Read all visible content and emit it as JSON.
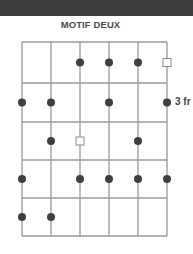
{
  "header": {
    "title": "MOTIF DEUX"
  },
  "diagram": {
    "type": "guitar-fretboard",
    "strings": 6,
    "frets": 5,
    "start_fret_label": "3 fr",
    "start_fret_label_row": 2,
    "colors": {
      "grid": "#9a9a9a",
      "dot": "#3f3f3f",
      "square_stroke": "#8a8a8a",
      "topbar": "#3d3d3d"
    },
    "markers": [
      {
        "fret": 1,
        "string": 3,
        "shape": "dot"
      },
      {
        "fret": 1,
        "string": 4,
        "shape": "dot"
      },
      {
        "fret": 1,
        "string": 5,
        "shape": "dot"
      },
      {
        "fret": 1,
        "string": 6,
        "shape": "square"
      },
      {
        "fret": 2,
        "string": 1,
        "shape": "dot"
      },
      {
        "fret": 2,
        "string": 2,
        "shape": "dot"
      },
      {
        "fret": 2,
        "string": 4,
        "shape": "dot"
      },
      {
        "fret": 2,
        "string": 6,
        "shape": "dot"
      },
      {
        "fret": 3,
        "string": 2,
        "shape": "dot"
      },
      {
        "fret": 3,
        "string": 3,
        "shape": "square"
      },
      {
        "fret": 3,
        "string": 5,
        "shape": "dot"
      },
      {
        "fret": 4,
        "string": 1,
        "shape": "dot"
      },
      {
        "fret": 4,
        "string": 3,
        "shape": "dot"
      },
      {
        "fret": 4,
        "string": 4,
        "shape": "dot"
      },
      {
        "fret": 4,
        "string": 5,
        "shape": "dot"
      },
      {
        "fret": 4,
        "string": 6,
        "shape": "dot"
      },
      {
        "fret": 5,
        "string": 1,
        "shape": "dot"
      },
      {
        "fret": 5,
        "string": 2,
        "shape": "dot"
      }
    ]
  }
}
